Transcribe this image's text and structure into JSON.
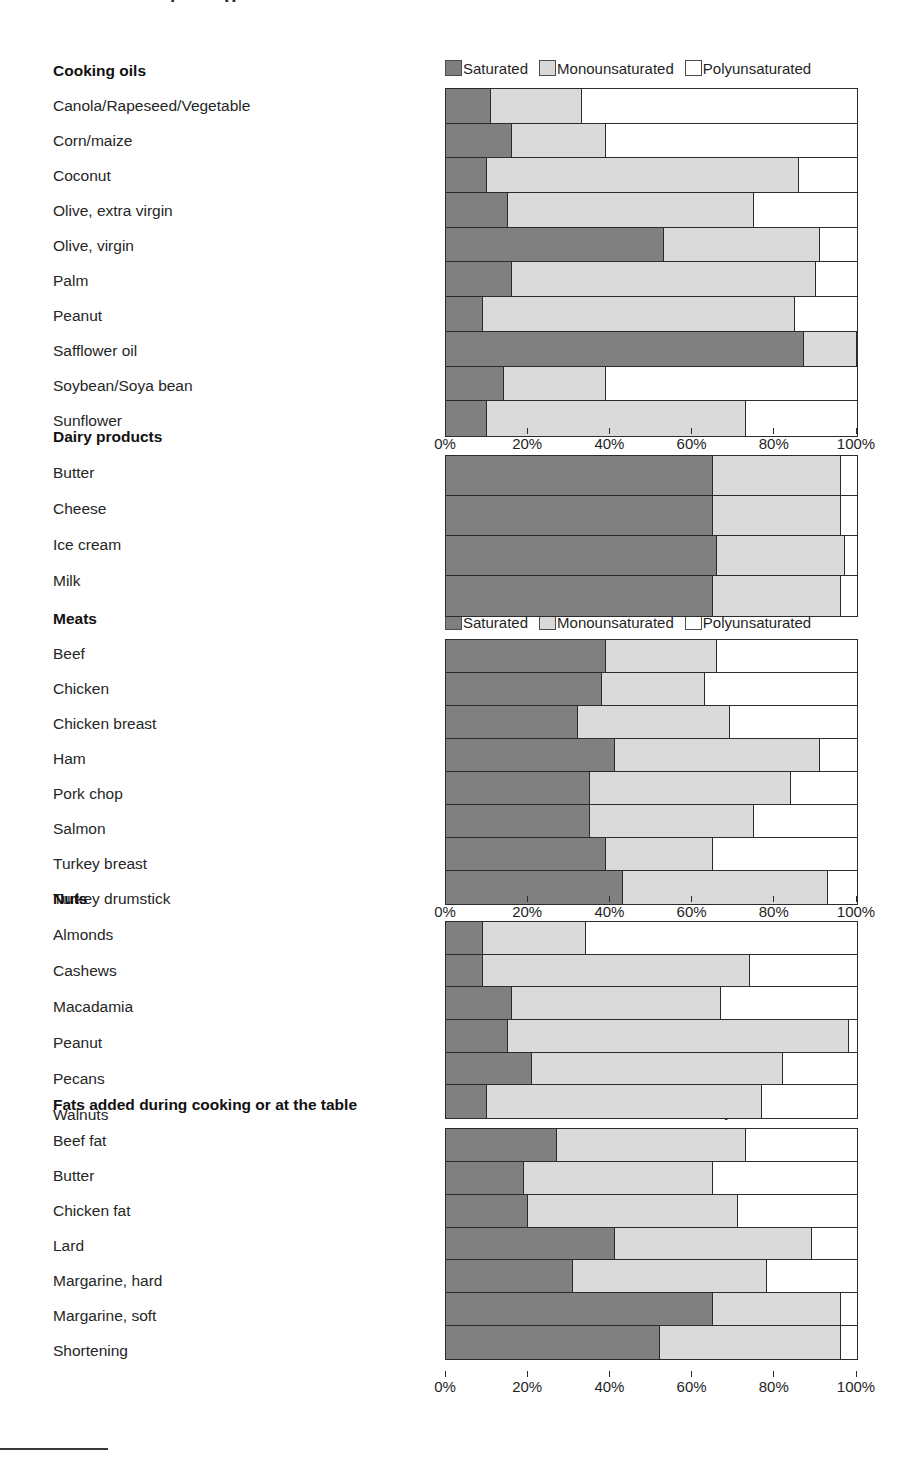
{
  "artifacts": {
    "top_partial_text": "ı o",
    "bottom_rule": true
  },
  "legend": {
    "saturated": "Saturated",
    "monounsaturated": "Monounsaturated",
    "polyunsaturated": "Polyunsaturated",
    "colors": {
      "saturated": "#808080",
      "monounsaturated": "#dadada",
      "polyunsaturated": "#ffffff",
      "outline": "#2b2b2b"
    }
  },
  "axis": {
    "ticks": [
      "0%",
      "20%",
      "40%",
      "60%",
      "80%",
      "100%"
    ],
    "values": [
      0,
      20,
      40,
      60,
      80,
      100
    ]
  },
  "groups": [
    {
      "title": "Cooking oils",
      "items": [
        "Canola/Rapeseed/Vegetable",
        "Corn/maize",
        "Coconut",
        "Olive, extra virgin",
        "Olive, virgin",
        "Palm",
        "Peanut",
        "Safflower oil",
        "Soybean/Soya bean",
        "Sunflower"
      ]
    },
    {
      "title": "Dairy products",
      "items": [
        "Butter",
        "Cheese",
        "Ice cream",
        "Milk"
      ]
    },
    {
      "title": "Meats",
      "items": [
        "Beef",
        "Chicken",
        "Chicken breast",
        "Ham",
        "Pork chop",
        "Salmon",
        "Turkey breast",
        "Turkey drumstick"
      ]
    },
    {
      "title": "Nuts",
      "items": [
        "Almonds",
        "Cashews",
        "Macadamia",
        "Peanut",
        "Pecans",
        "Walnuts"
      ]
    },
    {
      "title": "Fats added during cooking or at the table",
      "items": [
        "Beef fat",
        "Butter",
        "Chicken fat",
        "Lard",
        "Margarine, hard",
        "Margarine, soft",
        "Shortening"
      ]
    }
  ],
  "chart_data": {
    "type": "bar",
    "orientation": "horizontal",
    "stacked": true,
    "normalized": true,
    "title": "",
    "xlabel": "",
    "ylabel": "",
    "xlim": [
      0,
      100
    ],
    "xticks": [
      0,
      20,
      40,
      60,
      80,
      100
    ],
    "xticklabels": [
      "0%",
      "20%",
      "40%",
      "60%",
      "80%",
      "100%"
    ],
    "grid": false,
    "legend_position": "above-plot",
    "series_names": [
      "Saturated",
      "Monounsaturated",
      "Polyunsaturated"
    ],
    "panels": [
      {
        "name": "Cooking oils",
        "categories": [
          "Canola/Rapeseed/Vegetable",
          "Corn/maize",
          "Coconut",
          "Olive, extra virgin",
          "Olive, virgin",
          "Palm",
          "Peanut",
          "Safflower oil",
          "Soybean/Soya bean",
          "Sunflower"
        ],
        "series": [
          {
            "name": "Saturated",
            "values": [
              11,
              16,
              10,
              15,
              53,
              16,
              9,
              87,
              14,
              10
            ]
          },
          {
            "name": "Monounsaturated",
            "values": [
              22,
              23,
              76,
              60,
              38,
              74,
              76,
              13,
              25,
              63
            ]
          },
          {
            "name": "Polyunsaturated",
            "values": [
              67,
              61,
              14,
              25,
              9,
              10,
              15,
              0,
              61,
              27
            ]
          }
        ]
      },
      {
        "name": "Dairy products",
        "categories": [
          "Butter",
          "Cheese",
          "Ice cream",
          "Milk"
        ],
        "series": [
          {
            "name": "Saturated",
            "values": [
              65,
              65,
              66,
              65
            ]
          },
          {
            "name": "Monounsaturated",
            "values": [
              31,
              31,
              31,
              31
            ]
          },
          {
            "name": "Polyunsaturated",
            "values": [
              4,
              4,
              3,
              4
            ]
          }
        ]
      },
      {
        "name": "Meats",
        "categories": [
          "Beef",
          "Chicken",
          "Chicken breast",
          "Ham",
          "Pork chop",
          "Salmon",
          "Turkey breast",
          "Turkey drumstick"
        ],
        "series": [
          {
            "name": "Saturated",
            "values": [
              39,
              38,
              32,
              41,
              35,
              35,
              39,
              43
            ]
          },
          {
            "name": "Monounsaturated",
            "values": [
              27,
              25,
              37,
              50,
              49,
              40,
              26,
              50
            ]
          },
          {
            "name": "Polyunsaturated",
            "values": [
              34,
              37,
              31,
              9,
              16,
              25,
              35,
              7
            ]
          }
        ]
      },
      {
        "name": "Nuts",
        "categories": [
          "Almonds",
          "Cashews",
          "Macadamia",
          "Peanut",
          "Pecans",
          "Walnuts"
        ],
        "series": [
          {
            "name": "Saturated",
            "values": [
              9,
              9,
              16,
              15,
              21,
              10
            ]
          },
          {
            "name": "Monounsaturated",
            "values": [
              25,
              65,
              51,
              83,
              61,
              67
            ]
          },
          {
            "name": "Polyunsaturated",
            "values": [
              66,
              26,
              33,
              2,
              18,
              23
            ]
          }
        ]
      },
      {
        "name": "Fats added during cooking or at the table",
        "categories": [
          "Beef fat",
          "Butter",
          "Chicken fat",
          "Lard",
          "Margarine, hard",
          "Margarine, soft",
          "Shortening"
        ],
        "series": [
          {
            "name": "Saturated",
            "values": [
              27,
              19,
              20,
              41,
              31,
              65,
              52
            ]
          },
          {
            "name": "Monounsaturated",
            "values": [
              46,
              46,
              51,
              48,
              47,
              31,
              44
            ]
          },
          {
            "name": "Polyunsaturated",
            "values": [
              27,
              35,
              29,
              11,
              22,
              4,
              4
            ]
          }
        ]
      }
    ]
  },
  "layout": {
    "panel_tops": [
      88,
      455,
      639,
      921,
      1128
    ],
    "panel_heights": [
      347,
      160,
      264,
      196,
      230
    ],
    "legend_tops": [
      58,
      null,
      612,
      null,
      1101
    ],
    "axis_tops": [
      428,
      null,
      896,
      null,
      1371
    ],
    "label_tops": {
      "cooking_oils": [
        63,
        98,
        133,
        168,
        203,
        238,
        273,
        308,
        343,
        378,
        413
      ],
      "dairy": [
        429,
        465,
        501,
        537,
        573
      ],
      "meats": [
        611,
        646,
        681,
        716,
        751,
        786,
        821,
        856,
        891
      ],
      "nuts": [
        891,
        927,
        963,
        999,
        1035,
        1071,
        1107
      ],
      "fats": [
        1097,
        1133,
        1168,
        1203,
        1238,
        1273,
        1308,
        1343
      ]
    }
  }
}
